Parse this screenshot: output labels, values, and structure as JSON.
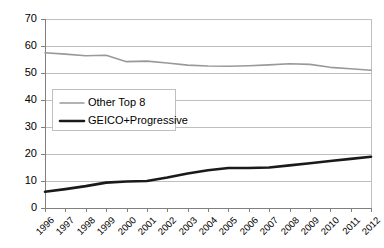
{
  "chart_data": {
    "type": "line",
    "title": "",
    "xlabel": "",
    "ylabel": "",
    "ylim": [
      0,
      70
    ],
    "ytick_step": 10,
    "yticks": [
      "0",
      "10",
      "20",
      "30",
      "40",
      "50",
      "60",
      "70"
    ],
    "grid": true,
    "legend_position": "inside-left",
    "categories": [
      "1996",
      "1997",
      "1998",
      "1999",
      "2000",
      "2001",
      "2002",
      "2003",
      "2004",
      "2005",
      "2006",
      "2007",
      "2008",
      "2009",
      "2010",
      "2011",
      "2012"
    ],
    "series": [
      {
        "name": "Other Top 8",
        "color": "#999999",
        "values": [
          57.5,
          57.0,
          56.4,
          56.6,
          54.2,
          54.4,
          53.7,
          52.9,
          52.6,
          52.5,
          52.7,
          53.0,
          53.4,
          53.2,
          52.1,
          51.6,
          51.0
        ]
      },
      {
        "name": "GEICO+Progressive",
        "color": "#1a1a1a",
        "values": [
          6.0,
          7.0,
          8.1,
          9.4,
          9.8,
          10.0,
          11.3,
          12.8,
          14.0,
          14.8,
          14.8,
          15.0,
          15.8,
          16.6,
          17.4,
          18.2,
          19.0
        ]
      }
    ]
  },
  "axis": {
    "plot_left": 45,
    "plot_right": 371,
    "plot_top": 19,
    "plot_bottom": 208
  },
  "legend": {
    "entries": [
      {
        "label": "Other Top 8",
        "color": "#999999",
        "swatch_width": 1.5
      },
      {
        "label": "GEICO+Progressive",
        "color": "#1a1a1a",
        "swatch_width": 2.6
      }
    ]
  },
  "colors": {
    "grid": "#bfbfbf",
    "axis": "#7f7f7f",
    "plot_border": "#bfbfbf",
    "background": "#ffffff",
    "text": "#000000"
  }
}
